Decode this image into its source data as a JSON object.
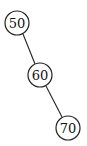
{
  "diagram": {
    "type": "binary-search-tree",
    "nodes": [
      {
        "id": "n50",
        "label": "50",
        "cx": 17,
        "cy": 23,
        "r": 12
      },
      {
        "id": "n60",
        "label": "60",
        "cx": 40,
        "cy": 75,
        "r": 12
      },
      {
        "id": "n70",
        "label": "70",
        "cx": 68,
        "cy": 128,
        "r": 12
      }
    ],
    "edges": [
      {
        "from": "n50",
        "to": "n60"
      },
      {
        "from": "n60",
        "to": "n70"
      }
    ],
    "colors": {
      "stroke": "#222222",
      "fill": "#ffffff",
      "text": "#111111"
    }
  }
}
